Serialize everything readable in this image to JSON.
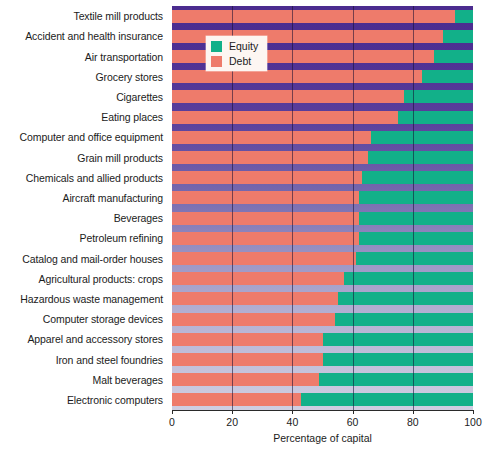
{
  "chart_data": {
    "type": "bar",
    "orientation": "horizontal",
    "stacked": true,
    "title": "",
    "xlabel": "Percentage of capital",
    "ylabel": "",
    "xlim": [
      0,
      100
    ],
    "xticks": [
      0,
      20,
      40,
      60,
      80,
      100
    ],
    "xtick_labels": [
      "0",
      "20",
      "40",
      "60",
      "80",
      "100"
    ],
    "grid": true,
    "legend_position": "upper-left-inside",
    "categories": [
      "Textile mill products",
      "Accident and health insurance",
      "Air transportation",
      "Grocery stores",
      "Cigarettes",
      "Eating places",
      "Computer and office equipment",
      "Grain mill products",
      "Chemicals and allied products",
      "Aircraft manufacturing",
      "Beverages",
      "Petroleum refining",
      "Catalog and mail-order houses",
      "Agricultural products: crops",
      "Hazardous waste management",
      "Computer storage devices",
      "Apparel and accessory stores",
      "Iron and steel foundries",
      "Malt beverages",
      "Electronic computers"
    ],
    "series": [
      {
        "name": "Debt",
        "color": "#ee7b6b",
        "values": [
          94,
          90,
          87,
          83,
          77,
          75,
          66,
          65,
          63,
          62,
          62,
          62,
          61,
          57,
          55,
          54,
          50,
          50,
          49,
          43
        ]
      },
      {
        "name": "Equity",
        "color": "#12b089",
        "values": [
          6,
          10,
          13,
          17,
          23,
          25,
          34,
          35,
          37,
          38,
          38,
          38,
          39,
          43,
          45,
          46,
          50,
          50,
          51,
          57
        ]
      }
    ],
    "legend": [
      {
        "label": "Equity",
        "color": "#12b089"
      },
      {
        "label": "Debt",
        "color": "#ee7b6b"
      }
    ]
  }
}
